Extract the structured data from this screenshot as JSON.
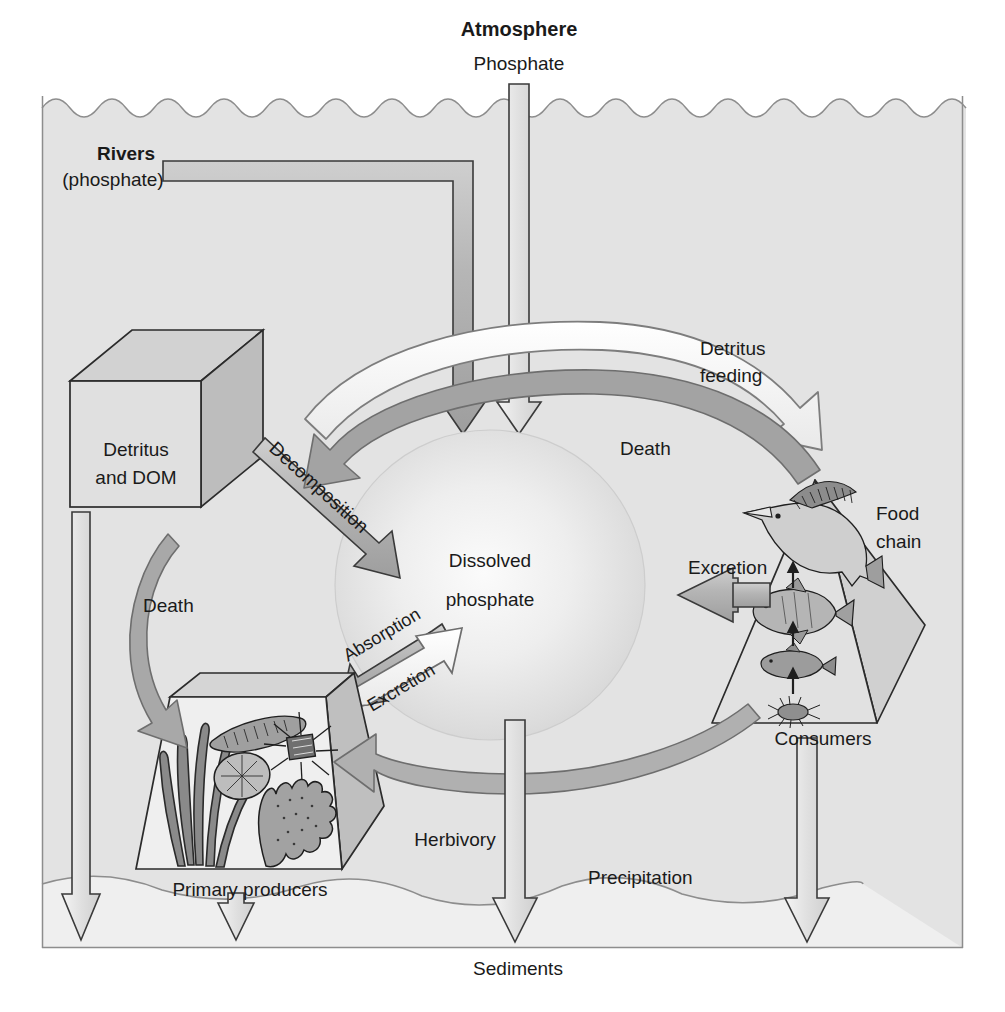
{
  "figure": {
    "type": "biogeochemical-cycle-diagram"
  },
  "colors": {
    "water": "#e4e4e4",
    "sky": "#fdfdfd",
    "sediment": "#efefef",
    "arrow_gray_fill": "#b0b0b0",
    "arrow_gray_dark": "#8f8f8f",
    "arrow_white_fill": "#f7f7f7",
    "outline": "#3a3a3a",
    "text": "#1a1a1a",
    "sphere_light": "#f2f2f2",
    "sphere_edge": "#c9c9c9"
  },
  "labels": {
    "atmosphere": "Atmosphere",
    "atmosphere_flux": "Phosphate",
    "rivers": "Rivers",
    "rivers_sub": "(phosphate)",
    "detritus": "Detritus",
    "detritus_line2": "and DOM",
    "decomposition": "Decomposition",
    "detritus_feeding_line1": "Detritus",
    "detritus_feeding_line2": "feeding",
    "death_top": "Death",
    "death_left": "Death",
    "dissolved_line1": "Dissolved",
    "dissolved_line2": "phosphate",
    "absorption": "Absorption",
    "excretion_producers": "Excretion",
    "excretion_consumers": "Excretion",
    "food_chain_line1": "Food",
    "food_chain_line2": "chain",
    "consumers": "Consumers",
    "primary_producers": "Primary producers",
    "herbivory": "Herbivory",
    "precipitation": "Precipitation",
    "sediments": "Sediments"
  },
  "compartments": [
    {
      "id": "atmosphere",
      "name": "Atmosphere",
      "position": "top-center-above-water"
    },
    {
      "id": "rivers",
      "name": "Rivers (phosphate)",
      "position": "upper-left"
    },
    {
      "id": "detritus",
      "name": "Detritus and DOM",
      "shape": "cube",
      "position": "left"
    },
    {
      "id": "dissolved-phosphate",
      "name": "Dissolved phosphate",
      "shape": "sphere",
      "position": "center"
    },
    {
      "id": "primary-producers",
      "name": "Primary producers",
      "shape": "trapezoid-box",
      "position": "lower-left"
    },
    {
      "id": "consumers",
      "name": "Consumers",
      "shape": "pyramid",
      "position": "right",
      "sublabel": "Food chain"
    },
    {
      "id": "sediments",
      "name": "Sediments",
      "position": "bottom"
    }
  ],
  "flows": [
    {
      "id": "atmosphere-to-dissolved",
      "label": "Phosphate",
      "from": "Atmosphere",
      "to": "Dissolved phosphate",
      "style": "gray-straight-down"
    },
    {
      "id": "rivers-to-dissolved",
      "label": "Rivers (phosphate)",
      "from": "Rivers",
      "to": "Dissolved phosphate",
      "style": "gray-elbow"
    },
    {
      "id": "decomposition",
      "label": "Decomposition",
      "from": "Detritus and DOM",
      "to": "Dissolved phosphate",
      "style": "gray-straight-diagonal"
    },
    {
      "id": "detritus-feeding",
      "label": "Detritus feeding",
      "from": "Detritus and DOM",
      "to": "Consumers",
      "style": "white-curved-right"
    },
    {
      "id": "death-consumers",
      "label": "Death",
      "from": "Consumers",
      "to": "Detritus and DOM",
      "style": "gray-curved-left"
    },
    {
      "id": "death-producers",
      "label": "Death",
      "from": "Primary producers",
      "to": "Detritus and DOM",
      "style": "gray-curved-up"
    },
    {
      "id": "absorption",
      "label": "Absorption",
      "from": "Dissolved phosphate",
      "to": "Primary producers",
      "style": "gray-diagonal-down-left"
    },
    {
      "id": "excretion-producers",
      "label": "Excretion",
      "from": "Primary producers",
      "to": "Dissolved phosphate",
      "style": "white-diagonal-up-right"
    },
    {
      "id": "excretion-consumers",
      "label": "Excretion",
      "from": "Consumers",
      "to": "Dissolved phosphate",
      "style": "gray-straight-left"
    },
    {
      "id": "herbivory",
      "label": "Herbivory",
      "from": "Primary producers",
      "to": "Consumers",
      "style": "gray-curved-arc"
    },
    {
      "id": "precipitation",
      "label": "Precipitation",
      "from": "Dissolved phosphate",
      "to": "Sediments",
      "style": "white-straight-down"
    },
    {
      "id": "detritus-to-sediments",
      "label": "",
      "from": "Detritus and DOM",
      "to": "Sediments",
      "style": "white-straight-down"
    },
    {
      "id": "producers-to-sediments",
      "label": "",
      "from": "Primary producers",
      "to": "Sediments",
      "style": "white-straight-down-short"
    },
    {
      "id": "consumers-to-sediments",
      "label": "",
      "from": "Consumers",
      "to": "Sediments",
      "style": "white-straight-down"
    }
  ],
  "food_chain": {
    "levels": [
      "copepod",
      "small fish",
      "mid fish",
      "billfish"
    ],
    "arrow_direction": "upward"
  },
  "primary_producer_organisms": [
    "filamentous algae",
    "pennate diatom",
    "centric diatom",
    "stellate diatom",
    "macroalga blade"
  ]
}
